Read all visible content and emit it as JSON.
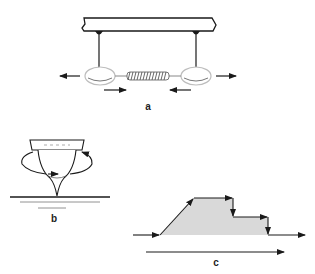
{
  "panels": {
    "a": {
      "label": "a",
      "description": "Two masses suspended from a beam connected by a spring"
    },
    "b": {
      "label": "b",
      "description": "Spinning top on a surface"
    },
    "c": {
      "label": "c",
      "description": "Stepped profile with directional arrows"
    }
  },
  "colors": {
    "stroke": "#1a1a1a",
    "fill_shaded": "#d9d9d9",
    "mass_fill": "#ffffff",
    "mass_edge": "#bdbdbd"
  }
}
